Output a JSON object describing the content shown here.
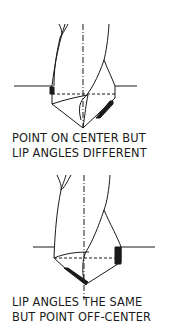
{
  "figures": [
    {
      "id": "drill-1",
      "caption_lines": [
        "POINT ON CENTER BUT",
        "LIP ANGLES DIFFERENT"
      ]
    },
    {
      "id": "drill-2",
      "caption_lines": [
        "LIP ANGLES THE SAME",
        "BUT POINT OFF-CENTER"
      ]
    }
  ],
  "colors": {
    "ink": "#1a1a1a",
    "background": "#ffffff"
  }
}
